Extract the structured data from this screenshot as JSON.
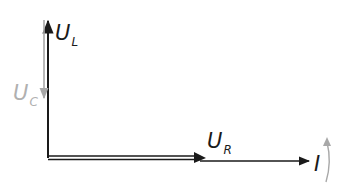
{
  "diagram": {
    "labels": {
      "UL": {
        "main": "U",
        "sub": "L"
      },
      "UC": {
        "main": "U",
        "sub": "C"
      },
      "UR": {
        "main": "U",
        "sub": "R"
      },
      "I": {
        "main": "I"
      }
    },
    "colors": {
      "primary": "#1a1a1a",
      "secondary": "#a8a8a8"
    }
  }
}
